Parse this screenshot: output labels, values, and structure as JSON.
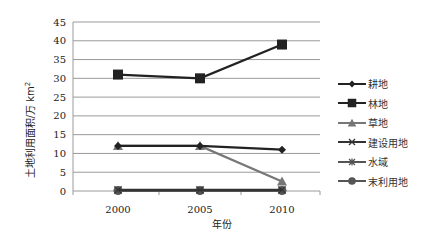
{
  "chart_data": {
    "type": "line",
    "title": "",
    "xlabel": "年份",
    "ylabel": "土地利用面积/万 km²",
    "x": [
      "2000",
      "2005",
      "2010"
    ],
    "ylim": [
      0,
      45
    ],
    "yticks": [
      0,
      5,
      10,
      15,
      20,
      25,
      30,
      35,
      40,
      45
    ],
    "grid": true,
    "legend_position": "right",
    "series": [
      {
        "name": "耕地",
        "marker": "diamond",
        "color": "#222222",
        "values": [
          12,
          12,
          11
        ]
      },
      {
        "name": "林地",
        "marker": "square",
        "color": "#222222",
        "values": [
          31,
          30,
          39
        ]
      },
      {
        "name": "草地",
        "marker": "triangle",
        "color": "#777777",
        "values": [
          12,
          12,
          2.5
        ]
      },
      {
        "name": "建设用地",
        "marker": "x",
        "color": "#333333",
        "values": [
          0.3,
          0.3,
          0.3
        ]
      },
      {
        "name": "水域",
        "marker": "star",
        "color": "#555555",
        "values": [
          0.2,
          0.2,
          0.2
        ]
      },
      {
        "name": "末利用地",
        "marker": "circle",
        "color": "#555555",
        "values": [
          0.1,
          0.1,
          0.1
        ]
      }
    ]
  },
  "axis": {
    "ylabel": "土地利用面积/万 km",
    "ylabel_sup": "2",
    "xlabel": "年份"
  },
  "legend": [
    "耕地",
    "林地",
    "草地",
    "建设用地",
    "水域",
    "末利用地"
  ]
}
